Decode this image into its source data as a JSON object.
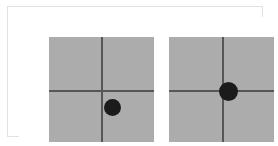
{
  "figure": {
    "background_color": "#ffffff",
    "frame": {
      "border_color": "#e2e2e2",
      "border_width_px": 1,
      "x": 7,
      "y": 6,
      "width": 256,
      "height": 131
    },
    "panel_fill_color": "#acacac",
    "axis_color": "#565656",
    "axis_thickness_px": 2,
    "dot_color": "#1b1b1b",
    "panels": [
      {
        "id": "left",
        "label": "left-panel",
        "x": 30,
        "y": 20,
        "width": 105,
        "height": 105,
        "crosshair": {
          "x": 53,
          "y": 54
        },
        "dot": {
          "center_x": 63,
          "center_y": 70,
          "diameter": 17
        },
        "dot_offset_from_center": {
          "dx": 10,
          "dy": 16
        },
        "dot_quadrant": "lower-right"
      },
      {
        "id": "right",
        "label": "right-panel",
        "x": 150,
        "y": 20,
        "width": 105,
        "height": 105,
        "crosshair": {
          "x": 54,
          "y": 54
        },
        "dot": {
          "center_x": 59,
          "center_y": 54,
          "diameter": 19
        },
        "dot_offset_from_center": {
          "dx": 5,
          "dy": 0
        },
        "dot_quadrant": "on-horizontal-axis-right"
      }
    ]
  }
}
